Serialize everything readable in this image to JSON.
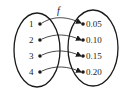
{
  "diagram": {
    "type": "function-mapping",
    "function_label": "f",
    "domain": [
      "1",
      "2",
      "3",
      "4"
    ],
    "range": [
      "0.05",
      "0.10",
      "0.15",
      "0.20"
    ],
    "mappings": [
      {
        "from": "1",
        "to": "0.05"
      },
      {
        "from": "2",
        "to": "0.10"
      },
      {
        "from": "3",
        "to": "0.15"
      },
      {
        "from": "4",
        "to": "0.20"
      }
    ]
  }
}
